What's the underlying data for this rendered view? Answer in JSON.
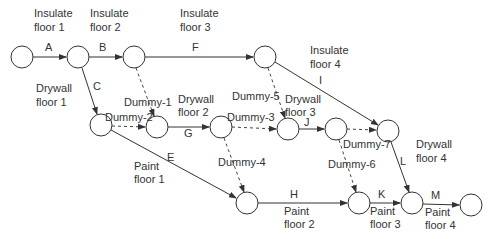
{
  "diagram": {
    "type": "activity-on-arrow network",
    "nodes": [
      {
        "id": "n1",
        "x": 22,
        "y": 57
      },
      {
        "id": "n2",
        "x": 78,
        "y": 57
      },
      {
        "id": "n3",
        "x": 134,
        "y": 57
      },
      {
        "id": "n4",
        "x": 265,
        "y": 57
      },
      {
        "id": "n5",
        "x": 101,
        "y": 125
      },
      {
        "id": "n6",
        "x": 157,
        "y": 127
      },
      {
        "id": "n7",
        "x": 221,
        "y": 127
      },
      {
        "id": "n8",
        "x": 288,
        "y": 129
      },
      {
        "id": "n9",
        "x": 336,
        "y": 129
      },
      {
        "id": "n10",
        "x": 388,
        "y": 131
      },
      {
        "id": "n11",
        "x": 247,
        "y": 203
      },
      {
        "id": "n12",
        "x": 359,
        "y": 203
      },
      {
        "id": "n13",
        "x": 412,
        "y": 203
      },
      {
        "id": "n14",
        "x": 471,
        "y": 205
      }
    ],
    "activities": [
      {
        "letter": "A",
        "desc_line1": "Insulate",
        "desc_line2": "floor 1",
        "from": "n1",
        "to": "n2"
      },
      {
        "letter": "B",
        "desc_line1": "Insulate",
        "desc_line2": "floor 2",
        "from": "n2",
        "to": "n3"
      },
      {
        "letter": "C",
        "desc_line1": "Drywall",
        "desc_line2": "floor 1",
        "from": "n2",
        "to": "n5"
      },
      {
        "letter": "F",
        "desc_line1": "Insulate",
        "desc_line2": "floor 3",
        "from": "n3",
        "to": "n4"
      },
      {
        "letter": "I",
        "desc_line1": "Insulate",
        "desc_line2": "floor 4",
        "from": "n4",
        "to": "n10"
      },
      {
        "letter": "G",
        "desc_line1": "Drywall",
        "desc_line2": "floor 2",
        "from": "n6",
        "to": "n7"
      },
      {
        "letter": "J",
        "desc_line1": "Drywall",
        "desc_line2": "floor 3",
        "from": "n8",
        "to": "n9"
      },
      {
        "letter": "L",
        "desc_line1": "Drywall",
        "desc_line2": "floor 4",
        "from": "n10",
        "to": "n13"
      },
      {
        "letter": "E",
        "desc_line1": "Paint",
        "desc_line2": "floor 1",
        "from": "n5",
        "to": "n11"
      },
      {
        "letter": "H",
        "desc_line1": "Paint",
        "desc_line2": "floor 2",
        "from": "n11",
        "to": "n12"
      },
      {
        "letter": "K",
        "desc_line1": "Paint",
        "desc_line2": "floor 3",
        "from": "n12",
        "to": "n13"
      },
      {
        "letter": "M",
        "desc_line1": "Paint",
        "desc_line2": "floor 4",
        "from": "n13",
        "to": "n14"
      }
    ],
    "dummies": [
      {
        "label": "Dummy-1",
        "from": "n3",
        "to": "n6"
      },
      {
        "label": "Dummy-2",
        "from": "n5",
        "to": "n6"
      },
      {
        "label": "Dummy-3",
        "from": "n7",
        "to": "n8"
      },
      {
        "label": "Dummy-4",
        "from": "n7",
        "to": "n11"
      },
      {
        "label": "Dummy-5",
        "from": "n4",
        "to": "n8"
      },
      {
        "label": "Dummy-6",
        "from": "n9",
        "to": "n12"
      },
      {
        "label": "Dummy-7",
        "from": "n9",
        "to": "n10"
      }
    ]
  }
}
